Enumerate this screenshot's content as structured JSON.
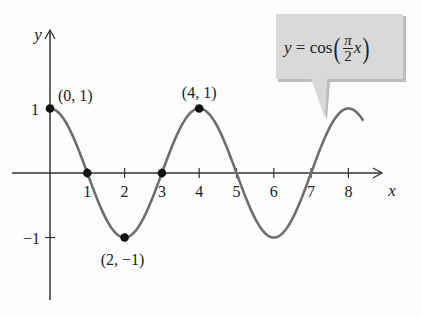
{
  "chart_data": {
    "type": "line",
    "title": "",
    "function": "y = cos(pi/2 x)",
    "xlabel": "x",
    "ylabel": "y",
    "xlim": [
      0,
      8.4
    ],
    "ylim": [
      -1,
      1
    ],
    "x_ticks": [
      "1",
      "2",
      "3",
      "4",
      "5",
      "6",
      "7",
      "8"
    ],
    "y_ticks": [
      "1",
      "-1"
    ],
    "grid": false,
    "series": [
      {
        "name": "y = cos(pi/2 x)",
        "x": [
          0,
          0.5,
          1,
          1.5,
          2,
          2.5,
          3,
          3.5,
          4,
          4.5,
          5,
          5.5,
          6,
          6.5,
          7,
          7.5,
          8,
          8.4
        ],
        "values": [
          1,
          0.707,
          0,
          -0.707,
          -1,
          -0.707,
          0,
          0.707,
          1,
          0.707,
          0,
          -0.707,
          -1,
          -0.707,
          0,
          0.707,
          1,
          0.95
        ]
      }
    ],
    "marked_points": [
      {
        "x": 0,
        "y": 1,
        "label": "(0, 1)"
      },
      {
        "x": 1,
        "y": 0,
        "label": ""
      },
      {
        "x": 2,
        "y": -1,
        "label": "(2, −1)"
      },
      {
        "x": 3,
        "y": 0,
        "label": ""
      },
      {
        "x": 4,
        "y": 1,
        "label": "(4, 1)"
      }
    ],
    "annotation": {
      "lhs": "y = cos",
      "numerator": "π",
      "denominator": "2",
      "var": "x"
    },
    "colors": {
      "curve": "#6e6e6e",
      "axis": "#333333",
      "callout": "#d9d9d9"
    }
  }
}
